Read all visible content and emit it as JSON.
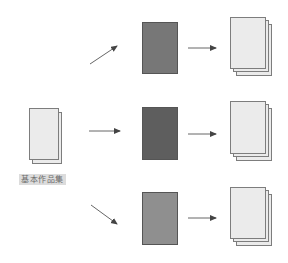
{
  "diagram": {
    "source": {
      "label": "基本作品集",
      "sheets": 2,
      "color": "#ebebeb"
    },
    "rows": [
      {
        "variant_color": "#777777",
        "output_sheets": 3,
        "arrow_in": "diagonal-up"
      },
      {
        "variant_color": "#5e5e5e",
        "output_sheets": 3,
        "arrow_in": "horizontal"
      },
      {
        "variant_color": "#8f8f8f",
        "output_sheets": 3,
        "arrow_in": "diagonal-down"
      }
    ],
    "colors": {
      "arrow": "#555555",
      "sheet_border": "#7d7d7d",
      "sheet_fill": "#ebebeb",
      "label_bg": "#dcdcdc"
    }
  }
}
